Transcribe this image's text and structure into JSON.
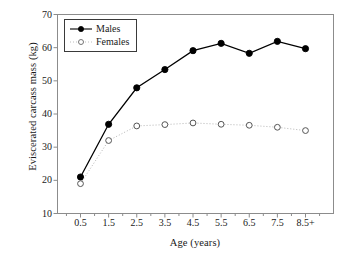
{
  "chart_data": {
    "type": "line",
    "title": "",
    "xlabel": "Age (years)",
    "ylabel": "Eviscerated carcass mass (kg)",
    "categories": [
      "0.5",
      "1.5",
      "2.5",
      "3.5",
      "4.5",
      "5.5",
      "6.5",
      "7.5",
      "8.5+"
    ],
    "xtick_labels": [
      "0.5",
      "1.5",
      "2.5",
      "3.5",
      "4.5",
      "5.5",
      "6.5",
      "7.5",
      "8.5+"
    ],
    "ytick_labels": [
      "10",
      "20",
      "30",
      "40",
      "50",
      "60",
      "70"
    ],
    "ytick_values": [
      10,
      20,
      30,
      40,
      50,
      60,
      70
    ],
    "ylim": [
      10,
      70
    ],
    "grid": false,
    "legend_position": "top-left",
    "series": [
      {
        "name": "Males",
        "values": [
          21.0,
          36.9,
          47.9,
          53.4,
          59.1,
          61.3,
          58.3,
          61.9,
          59.7
        ],
        "marker": "filled-circle",
        "line_style": "solid",
        "color": "#000000"
      },
      {
        "name": "Females",
        "values": [
          19.0,
          32.0,
          36.4,
          36.8,
          37.3,
          36.9,
          36.6,
          36.0,
          35.0
        ],
        "marker": "open-circle",
        "line_style": "dotted",
        "color": "#909090"
      }
    ]
  },
  "legend": {
    "items": [
      {
        "label": "Males"
      },
      {
        "label": "Females"
      }
    ]
  },
  "axes": {
    "x_title": "Age (years)",
    "y_title": "Eviscerated carcass mass (kg)"
  }
}
